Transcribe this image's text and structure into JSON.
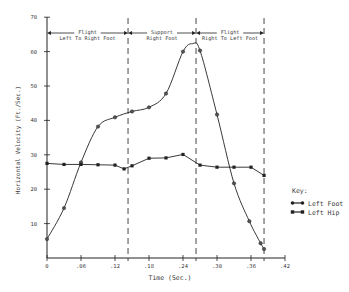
{
  "chart_data": {
    "type": "line",
    "title": "",
    "xlabel": "Time (Sec.)",
    "ylabel": "Horizontal Velocity (Ft./Sec.)",
    "xlim": [
      0,
      0.42
    ],
    "ylim": [
      0,
      70
    ],
    "x_ticks": [
      "0",
      ".06",
      ".12",
      ".18",
      ".24",
      ".30",
      ".36",
      ".42"
    ],
    "x_tick_values": [
      0,
      0.06,
      0.12,
      0.18,
      0.24,
      0.3,
      0.36,
      0.42
    ],
    "y_ticks": [
      "10",
      "20",
      "30",
      "40",
      "50",
      "60",
      "70"
    ],
    "y_tick_values": [
      10,
      20,
      30,
      40,
      50,
      60,
      70
    ],
    "grid": false,
    "legend_position": "right",
    "legend_title": "Key:",
    "series": [
      {
        "name": "Left Foot",
        "marker": "circle",
        "points": [
          [
            0.0,
            5.5
          ],
          [
            0.03,
            14.5
          ],
          [
            0.06,
            27.8
          ],
          [
            0.09,
            38.2
          ],
          [
            0.12,
            40.9
          ],
          [
            0.15,
            42.6
          ],
          [
            0.18,
            43.8
          ],
          [
            0.21,
            47.8
          ],
          [
            0.24,
            60.0
          ],
          [
            0.27,
            60.3
          ],
          [
            0.3,
            41.7
          ],
          [
            0.33,
            21.7
          ],
          [
            0.357,
            10.7
          ],
          [
            0.377,
            4.3
          ],
          [
            0.383,
            2.6
          ]
        ],
        "peak": [
          0.257,
          62.3
        ]
      },
      {
        "name": "Left Hip",
        "marker": "square",
        "points": [
          [
            0.0,
            27.5
          ],
          [
            0.03,
            27.2
          ],
          [
            0.06,
            27.2
          ],
          [
            0.09,
            27.1
          ],
          [
            0.12,
            27.0
          ],
          [
            0.136,
            25.9
          ],
          [
            0.15,
            26.8
          ],
          [
            0.18,
            29.0
          ],
          [
            0.21,
            29.1
          ],
          [
            0.24,
            30.1
          ],
          [
            0.27,
            27.0
          ],
          [
            0.3,
            26.4
          ],
          [
            0.33,
            26.4
          ],
          [
            0.36,
            26.4
          ],
          [
            0.383,
            24.0
          ]
        ]
      }
    ],
    "phase_boundaries": [
      0.143,
      0.263,
      0.383
    ],
    "annotations": [
      {
        "line1": "Flight",
        "line2": "Left To Right Foot",
        "from": 0.0,
        "to": 0.143
      },
      {
        "line1": "Support",
        "line2": "Right Foot",
        "from": 0.143,
        "to": 0.263
      },
      {
        "line1": "Flight",
        "line2": "Right To Left Foot",
        "from": 0.263,
        "to": 0.383
      }
    ]
  },
  "legend": {
    "title": "Key:",
    "items": [
      {
        "label": "Left Foot"
      },
      {
        "label": "Left Hip"
      }
    ]
  },
  "axes": {
    "xlabel": "Time (Sec.)",
    "ylabel": "Horizontal Velocity (Ft./Sec.)"
  }
}
